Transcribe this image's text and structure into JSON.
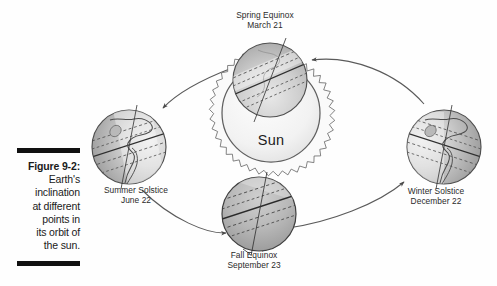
{
  "figure": {
    "number": "Figure 9-2:",
    "caption_lines": [
      "Earth's",
      "inclination",
      "at different",
      "points in",
      "its orbit of",
      "the sun."
    ]
  },
  "diagram": {
    "center_body": {
      "name": "Sun",
      "label": "Sun"
    },
    "positions": [
      {
        "id": "spring-equinox",
        "title": "Spring Equinox",
        "date": "March 21"
      },
      {
        "id": "summer-solstice",
        "title": "Summer Solstice",
        "date": "June 22"
      },
      {
        "id": "fall-equinox",
        "title": "Fall Equinox",
        "date": "September 23"
      },
      {
        "id": "winter-solstice",
        "title": "Winter Solstice",
        "date": "December 22"
      }
    ]
  },
  "colors": {
    "ink": "#1a1a1a",
    "rule_bar": "#111111",
    "orbit_line": "#555555",
    "globe_light": "#d8d8d8",
    "globe_dark": "#a9a9a9",
    "globe_shadow": "#9a9a9a",
    "sun_fill": "#f4f4f4",
    "sun_rim": "#6a6a6a",
    "page_background": "#ffffff"
  }
}
